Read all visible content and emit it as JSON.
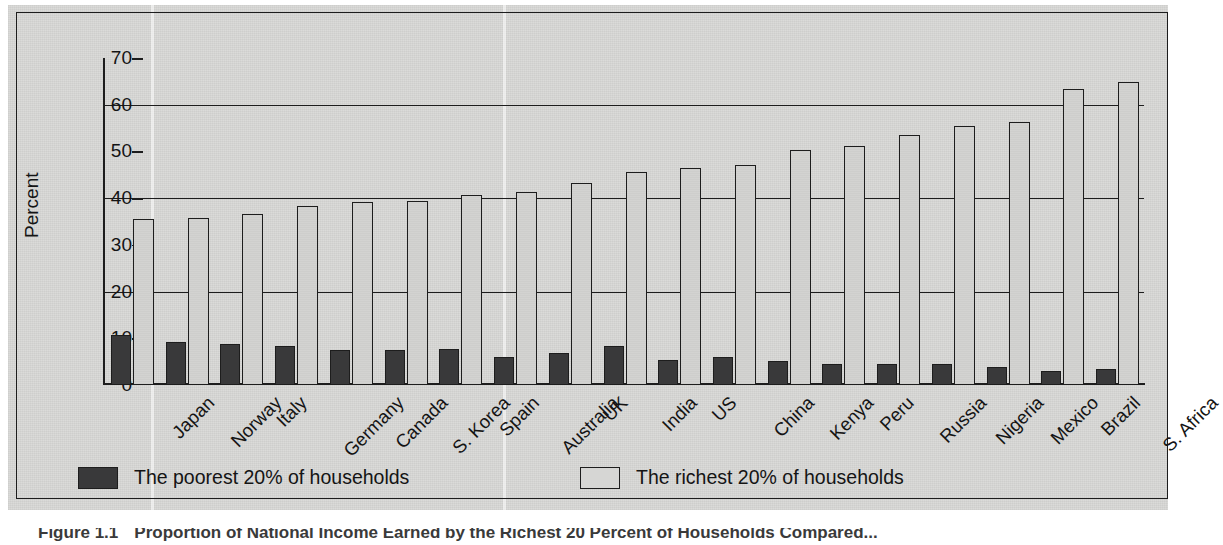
{
  "figure": {
    "caption_number": "Figure 1.1",
    "caption_text": "Proportion of National Income Earned by the Richest 20 Percent of Households Compared..."
  },
  "axes": {
    "ylabel": "Percent",
    "yticks": [
      "0",
      "10",
      "20",
      "30",
      "40",
      "50",
      "60",
      "70"
    ],
    "gridline_values": [
      20,
      40,
      60
    ],
    "ymin": 0,
    "ymax": 70
  },
  "legend": {
    "items": [
      {
        "label": "The poorest 20% of households",
        "swatch": "poor",
        "color": "#39393a"
      },
      {
        "label": "The richest 20% of households",
        "swatch": "rich",
        "color": "#d6d6d4"
      }
    ]
  },
  "chart_data": {
    "type": "bar",
    "title": "Proportion of National Income Earned by the Richest 20 Percent of Households Compared...",
    "xlabel": "",
    "ylabel": "Percent",
    "ylim": [
      0,
      70
    ],
    "grid": true,
    "legend_position": "bottom",
    "categories": [
      "Japan",
      "Norway",
      "Italy",
      "Germany",
      "Canada",
      "S. Korea",
      "Spain",
      "Australia",
      "UK",
      "India",
      "US",
      "China",
      "Kenya",
      "Peru",
      "Russia",
      "Nigeria",
      "Mexico",
      "Brazil",
      "S. Africa"
    ],
    "series": [
      {
        "name": "The poorest 20% of households",
        "color": "#39393a",
        "values": [
          10.8,
          9.3,
          8.7,
          8.4,
          7.6,
          7.6,
          7.7,
          5.9,
          6.8,
          8.4,
          5.4,
          5.9,
          5.2,
          4.4,
          4.4,
          4.4,
          3.8,
          2.9,
          3.4
        ]
      },
      {
        "name": "The richest 20% of households",
        "color": "#d2d2d0",
        "values": [
          35.5,
          35.7,
          36.6,
          38.4,
          39.2,
          39.3,
          40.6,
          41.3,
          43.2,
          45.7,
          46.4,
          47.1,
          50.3,
          51.1,
          53.5,
          55.5,
          56.2,
          63.4,
          64.8
        ]
      }
    ]
  }
}
